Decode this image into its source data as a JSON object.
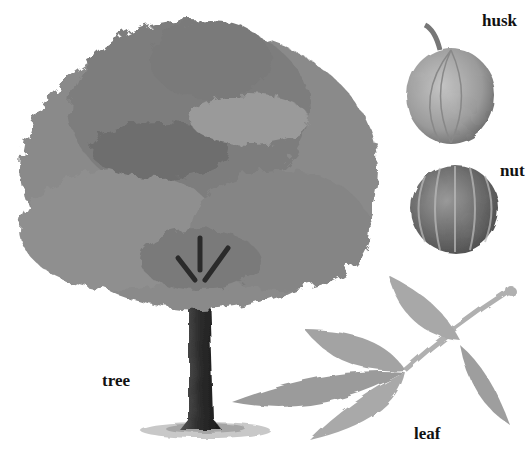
{
  "figure": {
    "background": "#ffffff",
    "palette": {
      "foliage": "#7a7a7a",
      "foliage_dark": "#5a5a5a",
      "trunk": "#2e2e2e",
      "husk": "#9a9a9a",
      "nut": "#6e6e6e",
      "leaf": "#a8a8a8",
      "stem": "#b5b5b5"
    },
    "labels": {
      "husk": "husk",
      "nut": "nut",
      "tree": "tree",
      "leaf": "leaf"
    },
    "parts": [
      {
        "id": "tree",
        "label": "tree"
      },
      {
        "id": "husk",
        "label": "husk"
      },
      {
        "id": "nut",
        "label": "nut"
      },
      {
        "id": "leaf",
        "label": "leaf"
      }
    ]
  }
}
